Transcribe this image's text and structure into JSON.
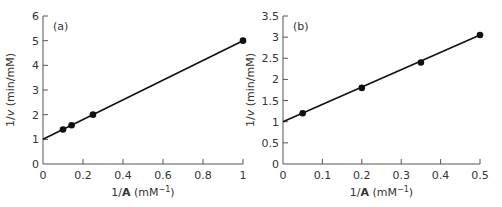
{
  "chart_data": [
    {
      "type": "scatter",
      "panel_label": "(a)",
      "title": "",
      "xlabel": "1/A (mM⁻¹)",
      "ylabel": "1/v (min/mM)",
      "xlim": [
        0,
        1
      ],
      "ylim": [
        0,
        6
      ],
      "xticks": [
        "0",
        "0.2",
        "0.4",
        "0.6",
        "0.8",
        "1"
      ],
      "yticks": [
        "0",
        "1",
        "2",
        "3",
        "4",
        "5",
        "6"
      ],
      "grid": false,
      "series": [
        {
          "name": "data",
          "x": [
            0.1,
            0.143,
            0.25,
            1.0
          ],
          "y": [
            1.4,
            1.57,
            2.0,
            5.0
          ]
        }
      ],
      "fit_line": {
        "x": [
          0,
          1.0
        ],
        "y": [
          1.0,
          5.0
        ],
        "intercept": 1.0,
        "slope": 4.0
      }
    },
    {
      "type": "scatter",
      "panel_label": "(b)",
      "title": "",
      "xlabel": "1/A (mM⁻¹)",
      "ylabel": "1/v (min/mM)",
      "xlim": [
        0,
        0.5
      ],
      "ylim": [
        0,
        3.5
      ],
      "xticks": [
        "0",
        "0.1",
        "0.2",
        "0.3",
        "0.4",
        "0.5"
      ],
      "yticks": [
        "0",
        "0.5",
        "1",
        "1.5",
        "2",
        "2.5",
        "3",
        "3.5"
      ],
      "grid": false,
      "series": [
        {
          "name": "data",
          "x": [
            0.05,
            0.2,
            0.35,
            0.5
          ],
          "y": [
            1.2,
            1.8,
            2.4,
            3.05
          ]
        }
      ],
      "fit_line": {
        "x": [
          0,
          0.5
        ],
        "y": [
          1.0,
          3.05
        ],
        "intercept": 1.0,
        "slope": 4.1
      }
    }
  ],
  "charts": {
    "a": {
      "panel": "(a)",
      "ylabel_prefix": "1/",
      "ylabel_var": "v",
      "ylabel_suffix": " (min/mM)",
      "xlabel_prefix": "1/",
      "xlabel_var": "A",
      "xlabel_unit": " (mM",
      "xlabel_exp": "−1",
      "xlabel_close": ")"
    },
    "b": {
      "panel": "(b)",
      "ylabel_prefix": "1/",
      "ylabel_var": "v",
      "ylabel_suffix": " (min/mM)",
      "xlabel_prefix": "1/",
      "xlabel_var": "A",
      "xlabel_unit": " (mM",
      "xlabel_exp": "−1",
      "xlabel_close": ")"
    }
  }
}
